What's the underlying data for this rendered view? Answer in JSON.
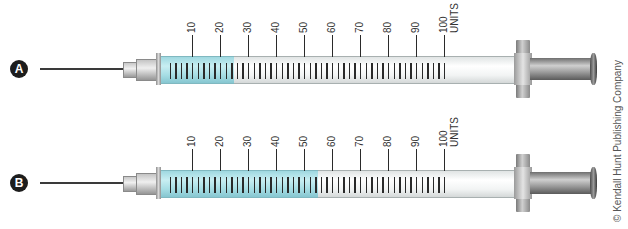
{
  "figure": {
    "credit": "© Kendall Hunt Publishing Company",
    "scale": {
      "unit_label": "UNITS",
      "major_ticks": [
        10,
        20,
        30,
        40,
        50,
        60,
        70,
        80,
        90,
        100
      ],
      "minor_step": 2,
      "max": 100
    },
    "colors": {
      "fill": "#a6dde4",
      "barrel": "#f2f4f4",
      "tick": "#2a2a2a",
      "label_circle": "#1d1d1d"
    },
    "syringes": [
      {
        "label": "A",
        "fill_units": 25
      },
      {
        "label": "B",
        "fill_units": 55
      }
    ]
  }
}
